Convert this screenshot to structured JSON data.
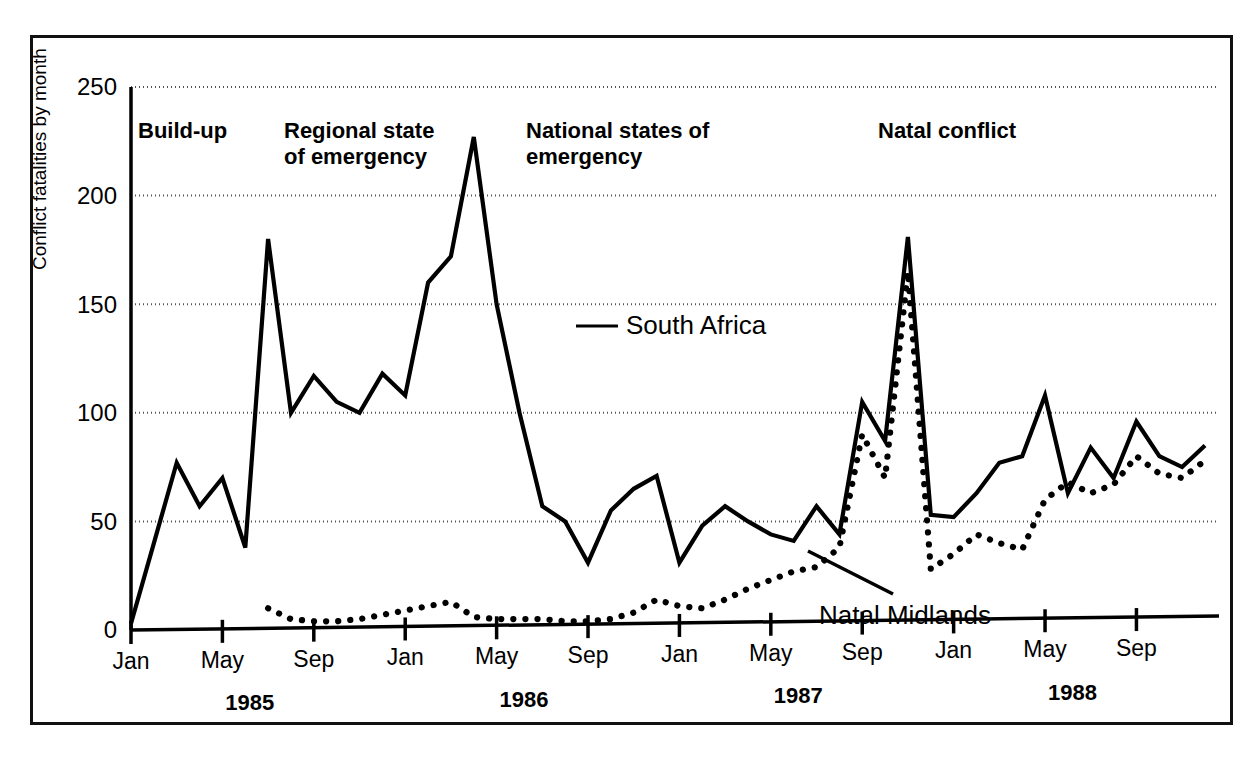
{
  "chart_data": {
    "type": "line",
    "title": "",
    "xlabel": "",
    "ylabel": "Conflict fatalities by month",
    "ylim": [
      0,
      250
    ],
    "yticks": [
      0,
      50,
      100,
      150,
      200,
      250
    ],
    "grid": "horizontal-dotted",
    "legend": "inline-annotations",
    "x_start": "1985-01",
    "x_end": "1988-12",
    "xtick_labels": [
      "Jan",
      "May",
      "Sep",
      "Jan",
      "May",
      "Sep",
      "Jan",
      "May",
      "Sep",
      "Jan",
      "May",
      "Sep"
    ],
    "xtick_months": [
      "1985-01",
      "1985-05",
      "1985-09",
      "1986-01",
      "1986-05",
      "1986-09",
      "1987-01",
      "1987-05",
      "1987-09",
      "1988-01",
      "1988-05",
      "1988-09"
    ],
    "year_labels": [
      "1985",
      "1986",
      "1987",
      "1988"
    ],
    "x": [
      "1985-01",
      "1985-02",
      "1985-03",
      "1985-04",
      "1985-05",
      "1985-06",
      "1985-07",
      "1985-08",
      "1985-09",
      "1985-10",
      "1985-11",
      "1985-12",
      "1986-01",
      "1986-02",
      "1986-03",
      "1986-04",
      "1986-05",
      "1986-06",
      "1986-07",
      "1986-08",
      "1986-09",
      "1986-10",
      "1986-11",
      "1986-12",
      "1987-01",
      "1987-02",
      "1987-03",
      "1987-04",
      "1987-05",
      "1987-06",
      "1987-07",
      "1987-08",
      "1987-09",
      "1987-10",
      "1987-11",
      "1987-12",
      "1988-01",
      "1988-02",
      "1988-03",
      "1988-04",
      "1988-05",
      "1988-06",
      "1988-07",
      "1988-08",
      "1988-09",
      "1988-10",
      "1988-11",
      "1988-12"
    ],
    "series": [
      {
        "name": "South Africa",
        "style": "solid",
        "color": "#000000",
        "values": [
          3,
          40,
          77,
          57,
          70,
          38,
          180,
          100,
          117,
          105,
          100,
          118,
          108,
          160,
          172,
          227,
          150,
          100,
          57,
          50,
          31,
          55,
          65,
          71,
          31,
          48,
          57,
          50,
          44,
          41,
          57,
          44,
          105,
          87,
          181,
          53,
          52,
          63,
          77,
          80,
          108,
          63,
          84,
          70,
          96,
          80,
          75,
          85
        ]
      },
      {
        "name": "Natal Midlands",
        "style": "dotted",
        "color": "#000000",
        "values": [
          null,
          null,
          null,
          null,
          null,
          null,
          10,
          5,
          4,
          4,
          5,
          7,
          9,
          11,
          13,
          6,
          5,
          5,
          5,
          4,
          4,
          5,
          8,
          14,
          11,
          10,
          14,
          19,
          23,
          27,
          29,
          38,
          90,
          70,
          165,
          28,
          35,
          44,
          40,
          37,
          60,
          68,
          63,
          67,
          80,
          72,
          70,
          78
        ]
      }
    ],
    "annotations": [
      {
        "name": "build-up",
        "lines": [
          "Build-up"
        ]
      },
      {
        "name": "regional-state-of-emergency",
        "lines": [
          "Regional state",
          "of emergency"
        ]
      },
      {
        "name": "national-states-of-emergency",
        "lines": [
          "National states of",
          "emergency"
        ]
      },
      {
        "name": "natal-conflict",
        "lines": [
          "Natal conflict"
        ]
      }
    ],
    "series_callouts": [
      {
        "name": "south-africa",
        "label": "South Africa"
      },
      {
        "name": "natal-midlands",
        "label": "Natal Midlands"
      }
    ]
  },
  "axis": {
    "y_title": "Conflict fatalities by month",
    "y_tick_0": "0",
    "y_tick_50": "50",
    "y_tick_100": "100",
    "y_tick_150": "150",
    "y_tick_200": "200",
    "y_tick_250": "250"
  },
  "xticks": [
    {
      "label": "Jan"
    },
    {
      "label": "May"
    },
    {
      "label": "Sep"
    },
    {
      "label": "Jan"
    },
    {
      "label": "May"
    },
    {
      "label": "Sep"
    },
    {
      "label": "Jan"
    },
    {
      "label": "May"
    },
    {
      "label": "Sep"
    },
    {
      "label": "Jan"
    },
    {
      "label": "May"
    },
    {
      "label": "Sep"
    }
  ],
  "years": [
    {
      "label": "1985"
    },
    {
      "label": "1986"
    },
    {
      "label": "1987"
    },
    {
      "label": "1988"
    }
  ],
  "phases": {
    "build_up": "Build-up",
    "regional_l1": "Regional state",
    "regional_l2": "of emergency",
    "national_l1": "National states of",
    "national_l2": "emergency",
    "natal": "Natal conflict"
  },
  "labels": {
    "south_africa": "South Africa",
    "natal_midlands": "Natal Midlands"
  },
  "colors": {
    "ink": "#000000",
    "grid": "#555555",
    "background": "#ffffff"
  }
}
